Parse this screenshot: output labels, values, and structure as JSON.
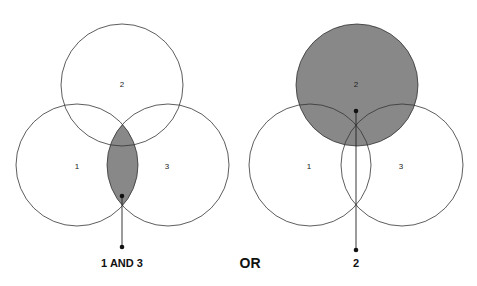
{
  "left_diagram": {
    "circle_labels": {
      "c1": "1",
      "c2": "2",
      "c3": "3"
    },
    "shaded_region": "intersection of 1 and 3",
    "caption": "1 AND 3"
  },
  "connector": {
    "label": "OR"
  },
  "right_diagram": {
    "circle_labels": {
      "c1": "1",
      "c2": "2",
      "c3": "3"
    },
    "shaded_region": "circle 2",
    "caption": "2"
  },
  "colors": {
    "shade": "#888888",
    "stroke": "#333333",
    "background": "#ffffff"
  }
}
